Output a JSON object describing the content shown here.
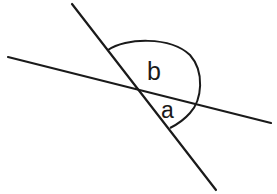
{
  "diagram": {
    "type": "intersecting-lines-angles",
    "stroke_color": "#1a1a1a",
    "background": "#ffffff",
    "lines": [
      {
        "name": "steep-line",
        "x1": 72,
        "y1": 4,
        "x2": 216,
        "y2": 190
      },
      {
        "name": "shallow-line",
        "x1": 8,
        "y1": 57,
        "x2": 271,
        "y2": 123
      }
    ],
    "intersection": {
      "x": 138,
      "y": 90
    },
    "arc": {
      "start": {
        "x": 108,
        "y": 50
      },
      "end": {
        "x": 170,
        "y": 128
      }
    },
    "labels": [
      {
        "name": "angle-b",
        "text": "b",
        "x": 150,
        "y": 79,
        "size": 24
      },
      {
        "name": "angle-a",
        "text": "a",
        "x": 160,
        "y": 117,
        "size": 22
      }
    ]
  }
}
